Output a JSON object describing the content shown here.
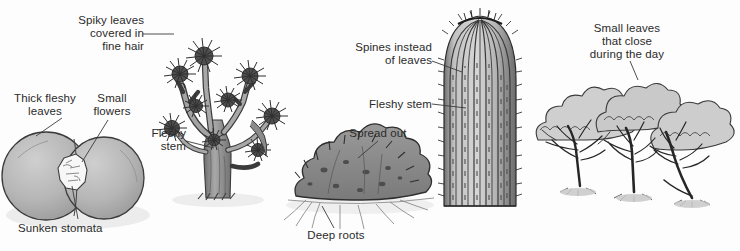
{
  "figure": {
    "kind": "desert-plant-adaptations-diagram",
    "background_color": "#fdfdfd",
    "ink_color": "#2b2b2b",
    "palette": {
      "lithops_fill": "#b4b4b4",
      "lithops_shadow": "#9a9a9a",
      "tree_fill": "#9d9d9d",
      "tree_dark": "#4a4a4a",
      "bush_fill": "#8a8a8a",
      "bush_dark": "#5e5e5e",
      "cactus_fill": "#b0b0b0",
      "cactus_rib": "#3c3c3c",
      "shrub_fill": "#cfcfcf",
      "shrub_branch": "#2e2e2e",
      "ground_shadow": "#e3e3e3"
    }
  },
  "plants": [
    {
      "id": "lithops",
      "name": "living-stones-plant",
      "labels": [
        {
          "id": "thick-fleshy-leaves",
          "text": "Thick fleshy\nleaves",
          "align": "center"
        },
        {
          "id": "small-flowers",
          "text": "Small\nflowers",
          "align": "center"
        },
        {
          "id": "sunken-stomata",
          "text": "Sunken stomata",
          "align": "left"
        }
      ]
    },
    {
      "id": "joshua-tree",
      "name": "joshua-tree",
      "labels": [
        {
          "id": "spiky-leaves",
          "text": "Spiky leaves\ncovered in\nfine hair",
          "align": "right"
        },
        {
          "id": "fleshy-stem-tree",
          "text": "Fleshy\nstem",
          "align": "right"
        }
      ]
    },
    {
      "id": "spreading-bush",
      "name": "spreading-desert-bush",
      "labels": [
        {
          "id": "spread-out",
          "text": "Spread out",
          "align": "center"
        },
        {
          "id": "deep-roots",
          "text": "Deep roots",
          "align": "center"
        }
      ]
    },
    {
      "id": "barrel-cactus",
      "name": "columnar-cactus",
      "labels": [
        {
          "id": "spines-instead-of-leaves",
          "text": "Spines instead\nof leaves",
          "align": "right"
        },
        {
          "id": "fleshy-stem-cactus",
          "text": "Fleshy stem",
          "align": "right"
        }
      ]
    },
    {
      "id": "small-leaf-shrubs",
      "name": "small-leaved-shrubs",
      "labels": [
        {
          "id": "small-leaves-close",
          "text": "Small leaves\nthat close\nduring the day",
          "align": "center"
        }
      ]
    }
  ],
  "annotations": {
    "thick_fleshy_leaves": "Thick fleshy\nleaves",
    "small_flowers": "Small\nflowers",
    "sunken_stomata": "Sunken stomata",
    "spiky_leaves": "Spiky leaves\ncovered in\nfine hair",
    "fleshy_stem_tree": "Fleshy\nstem",
    "spread_out": "Spread out",
    "deep_roots": "Deep roots",
    "spines_instead": "Spines instead\nof leaves",
    "fleshy_stem_cactus": "Fleshy stem",
    "small_leaves_close": "Small leaves\nthat close\nduring the day"
  }
}
